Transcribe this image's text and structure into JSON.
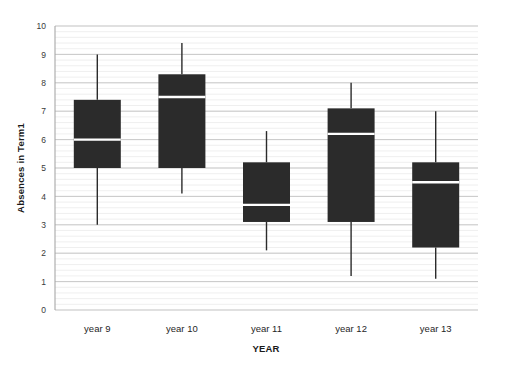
{
  "chart_data": {
    "type": "box",
    "title": "",
    "xlabel": "YEAR",
    "ylabel": "Absences in Term1",
    "categories": [
      "year 9",
      "year 10",
      "year 11",
      "year 12",
      "year 13"
    ],
    "ylim": [
      0,
      10
    ],
    "y_ticks": [
      0,
      1,
      2,
      3,
      4,
      5,
      6,
      7,
      8,
      9,
      10
    ],
    "y_tick_labels": [
      "0",
      "1",
      "2",
      "3",
      "4",
      "5",
      "6",
      "7",
      "8",
      "9",
      "10"
    ],
    "grid": "horizontal-minor-and-major",
    "legend": "none",
    "box_color": "#2b2b2b",
    "median_color": "#ffffff",
    "whisker_color": "#2b2b2b",
    "grid_color": "#e3e3e3",
    "axis_color": "#b5b5b5",
    "boxes": [
      {
        "category": "year 9",
        "min": 3.0,
        "q1": 5.0,
        "median": 6.0,
        "q3": 7.4,
        "max": 9.0
      },
      {
        "category": "year 10",
        "min": 4.1,
        "q1": 5.0,
        "median": 7.5,
        "q3": 8.3,
        "max": 9.4
      },
      {
        "category": "year 11",
        "min": 2.1,
        "q1": 3.1,
        "median": 3.7,
        "q3": 5.2,
        "max": 6.3
      },
      {
        "category": "year 12",
        "min": 1.2,
        "q1": 3.1,
        "median": 6.2,
        "q3": 7.1,
        "max": 8.0
      },
      {
        "category": "year 13",
        "min": 1.1,
        "q1": 2.2,
        "median": 4.5,
        "q3": 5.2,
        "max": 7.0
      }
    ]
  }
}
